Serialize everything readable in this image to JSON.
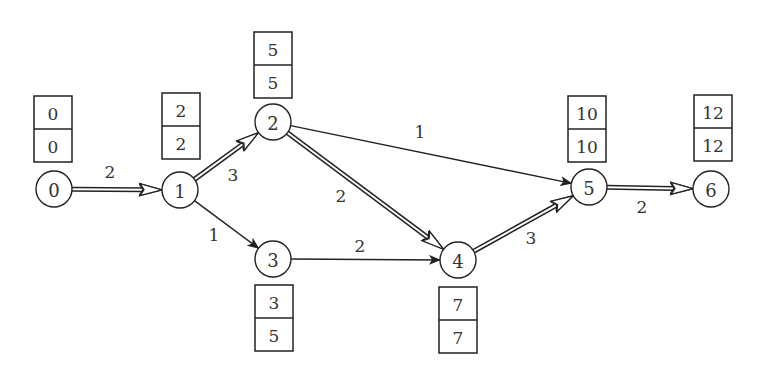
{
  "diagram": {
    "type": "activity-network",
    "nodes": [
      {
        "id": "0",
        "label": "0",
        "x": 54,
        "y": 189,
        "early": "0",
        "late": "0",
        "box": {
          "x": 34,
          "y": 96
        }
      },
      {
        "id": "1",
        "label": "1",
        "x": 180,
        "y": 190,
        "early": "2",
        "late": "2",
        "box": {
          "x": 162,
          "y": 93
        }
      },
      {
        "id": "2",
        "label": "2",
        "x": 273,
        "y": 122,
        "early": "5",
        "late": "5",
        "box": {
          "x": 254,
          "y": 32
        }
      },
      {
        "id": "3",
        "label": "3",
        "x": 273,
        "y": 259,
        "early": "3",
        "late": "5",
        "box": {
          "x": 255,
          "y": 285
        }
      },
      {
        "id": "4",
        "label": "4",
        "x": 458,
        "y": 260,
        "early": "7",
        "late": "7",
        "box": {
          "x": 439,
          "y": 287
        }
      },
      {
        "id": "5",
        "label": "5",
        "x": 589,
        "y": 187,
        "early": "10",
        "late": "10",
        "box": {
          "x": 568,
          "y": 96
        }
      },
      {
        "id": "6",
        "label": "6",
        "x": 711,
        "y": 189,
        "early": "12",
        "late": "12",
        "box": {
          "x": 694,
          "y": 95
        }
      }
    ],
    "edges": [
      {
        "from": "0",
        "to": "1",
        "weight": "2",
        "critical": true,
        "label_pos": {
          "x": 110,
          "y": 172
        }
      },
      {
        "from": "1",
        "to": "2",
        "weight": "3",
        "critical": true,
        "label_pos": {
          "x": 233,
          "y": 175
        }
      },
      {
        "from": "1",
        "to": "3",
        "weight": "1",
        "critical": false,
        "label_pos": {
          "x": 214,
          "y": 235
        }
      },
      {
        "from": "2",
        "to": "5",
        "weight": "1",
        "critical": false,
        "label_pos": {
          "x": 420,
          "y": 132
        }
      },
      {
        "from": "2",
        "to": "4",
        "weight": "2",
        "critical": true,
        "label_pos": {
          "x": 341,
          "y": 196
        }
      },
      {
        "from": "3",
        "to": "4",
        "weight": "2",
        "critical": false,
        "label_pos": {
          "x": 360,
          "y": 246
        }
      },
      {
        "from": "4",
        "to": "5",
        "weight": "3",
        "critical": true,
        "label_pos": {
          "x": 531,
          "y": 238
        }
      },
      {
        "from": "5",
        "to": "6",
        "weight": "2",
        "critical": true,
        "label_pos": {
          "x": 642,
          "y": 207
        }
      }
    ]
  }
}
